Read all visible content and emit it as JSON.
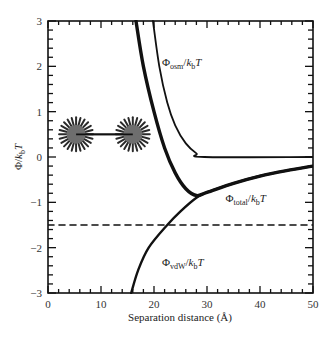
{
  "chart_data": {
    "type": "line",
    "title": "",
    "xlabel": "Separation distance (Å)",
    "ylabel": "Φ/k_bT",
    "xlim": [
      0,
      50
    ],
    "ylim": [
      -3,
      3
    ],
    "xticks": [
      0,
      10,
      20,
      30,
      40,
      50
    ],
    "yticks": [
      3,
      2,
      1,
      0,
      -1,
      -2,
      -3
    ],
    "xtick_labels": [
      "0",
      "10",
      "20",
      "30",
      "40",
      "50"
    ],
    "ytick_labels": [
      "3",
      "2",
      "1",
      "0",
      "−1",
      "−2",
      "−3"
    ],
    "x_minor_step": 2,
    "y_minor_step": 0.2,
    "grid": false,
    "legend": "inline labels",
    "series": [
      {
        "name": "Φ_total/k_bT",
        "style": "thick solid",
        "x": [
          16.6,
          18,
          20,
          22,
          24,
          26,
          28,
          30,
          35,
          40,
          45,
          50
        ],
        "y": [
          3,
          2.0,
          1.0,
          0.2,
          -0.35,
          -0.7,
          -0.85,
          -0.78,
          -0.58,
          -0.42,
          -0.3,
          -0.2
        ]
      },
      {
        "name": "Φ_osm/k_bT",
        "style": "thin solid",
        "x": [
          19.8,
          21,
          22.5,
          24,
          26,
          28,
          29.5,
          50
        ],
        "y": [
          3,
          2.0,
          1.2,
          0.7,
          0.3,
          0.08,
          0,
          0
        ]
      },
      {
        "name": "Φ_vdW/k_bT",
        "style": "medium solid",
        "x": [
          15.7,
          17,
          19,
          22.5,
          25,
          28,
          30,
          35,
          40,
          45,
          50
        ],
        "y": [
          -3,
          -2.5,
          -2.0,
          -1.5,
          -1.2,
          -0.9,
          -0.78,
          -0.58,
          -0.42,
          -0.3,
          -0.2
        ]
      },
      {
        "name": "reference level",
        "style": "dashed",
        "x": [
          0,
          50
        ],
        "y": [
          -1.5,
          -1.5
        ]
      }
    ],
    "annotations": [
      {
        "text_main": "Φ",
        "text_sub": "osm",
        "text_tail": "/k",
        "text_sub2": "b",
        "text_end": "T",
        "x": 21.5,
        "y": 2.0
      },
      {
        "text_main": "Φ",
        "text_sub": "total",
        "text_tail": "/k",
        "text_sub2": "b",
        "text_end": "T",
        "x": 33.5,
        "y": -1.0
      },
      {
        "text_main": "Φ",
        "text_sub": "vdW",
        "text_tail": "/k",
        "text_sub2": "b",
        "text_end": "T",
        "x": 21.5,
        "y": -2.4
      }
    ],
    "illustration": {
      "description": "two brush-coated particles connected by a line",
      "particles": [
        {
          "x": 5.3,
          "y": 0.5
        },
        {
          "x": 16.0,
          "y": 0.5
        }
      ],
      "core_color": "#6e6e6e",
      "spike_color": "#2a2a2a"
    }
  },
  "labels": {
    "xlabel": "Separation distance (Å)",
    "ylabel_main": "Φ/",
    "ylabel_k": "k",
    "ylabel_sub": "b",
    "ylabel_T": "T"
  }
}
